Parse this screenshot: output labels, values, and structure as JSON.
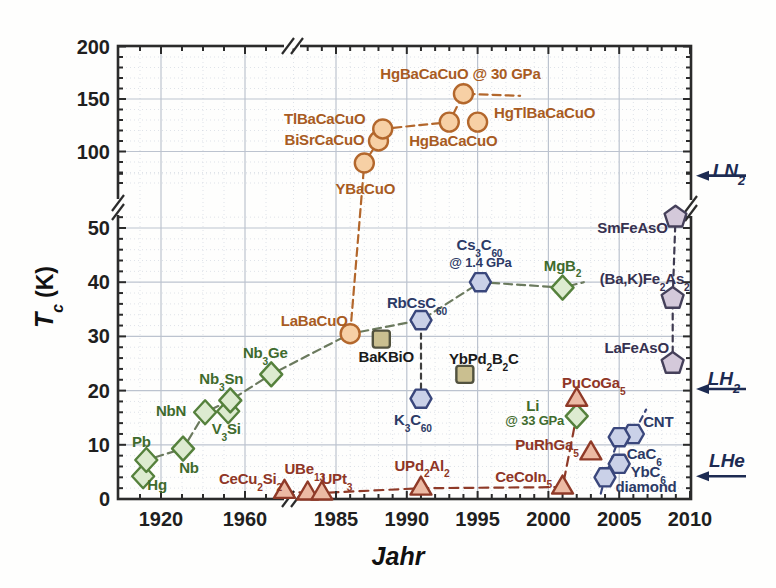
{
  "axes": {
    "xlabel": "Jahr",
    "ylabel_symbol": "T",
    "ylabel_subscript": "c",
    "ylabel_unit": "(K)",
    "x_ticks": [
      {
        "label": "1920",
        "year": 1920
      },
      {
        "label": "1960",
        "year": 1960
      },
      {
        "label": "1985",
        "year": 1985
      },
      {
        "label": "1990",
        "year": 1990
      },
      {
        "label": "1995",
        "year": 1995
      },
      {
        "label": "2000",
        "year": 2000
      },
      {
        "label": "2005",
        "year": 2005
      },
      {
        "label": "2010",
        "year": 2010
      }
    ],
    "y_ticks": [
      {
        "label": "0",
        "tc": 0
      },
      {
        "label": "10",
        "tc": 10
      },
      {
        "label": "20",
        "tc": 20
      },
      {
        "label": "30",
        "tc": 30
      },
      {
        "label": "40",
        "tc": 40
      },
      {
        "label": "50",
        "tc": 50
      },
      {
        "label": "100",
        "tc": 100
      },
      {
        "label": "150",
        "tc": 150
      },
      {
        "label": "200",
        "tc": 200
      }
    ]
  },
  "cryogens": {
    "color": "#1d2b52",
    "items": [
      {
        "id": "ln2",
        "label": "LN_2",
        "tc": 77,
        "label_dx": 3,
        "label_dy": -5
      },
      {
        "id": "lh2",
        "label": "LH_2",
        "tc": 20.3,
        "label_dx": -2,
        "label_dy": -10
      },
      {
        "id": "lhe",
        "label": "LHe",
        "tc": 4.2,
        "label_dx": 1,
        "label_dy": -15
      }
    ]
  },
  "chart_data": {
    "type": "scatter",
    "title": "",
    "xlabel": "Jahr",
    "ylabel": "T_c (K)",
    "x_axis": {
      "segments": [
        [
          1900,
          1976
        ],
        [
          1982,
          2010
        ]
      ],
      "break_between": [
        1976,
        1982
      ],
      "grid": true
    },
    "y_axis": {
      "unit": "K",
      "segments": [
        [
          0,
          55
        ],
        [
          60,
          200
        ]
      ],
      "break_between": [
        55,
        60
      ],
      "grid": true
    },
    "groups": {
      "conventional": {
        "marker_fill": "#ddebd0",
        "marker_stroke": "#55813c",
        "label_color": "#3f6b2d"
      },
      "cuprate": {
        "marker_fill": "#f7d0a5",
        "marker_stroke": "#b3672c",
        "label_color": "#a85b22"
      },
      "heavy_fermion": {
        "marker_fill": "#ecbaa4",
        "marker_stroke": "#8f3a28",
        "label_color": "#8f3626"
      },
      "carbon": {
        "marker_fill": "#cad1e8",
        "marker_stroke": "#3a477c",
        "label_color": "#2c3a66"
      },
      "iron_based": {
        "marker_fill": "#d4c9da",
        "marker_stroke": "#45405a",
        "label_color": "#363150"
      },
      "other": {
        "marker_fill": "#cabf90",
        "marker_stroke": "#52523f",
        "label_color": "#1a1a1a"
      }
    },
    "points": [
      {
        "name": "Hg",
        "group": "conventional",
        "shape": "diamond",
        "year": 1911.5,
        "tc": 4.2,
        "label": "Hg",
        "dx": 14,
        "dy": 9
      },
      {
        "name": "Pb",
        "group": "conventional",
        "shape": "diamond",
        "year": 1913,
        "tc": 7.2,
        "label": "Pb",
        "dx": -5,
        "dy": -18
      },
      {
        "name": "Nb",
        "group": "conventional",
        "shape": "diamond",
        "year": 1930.5,
        "tc": 9.3,
        "label": "Nb",
        "dx": 6,
        "dy": 19
      },
      {
        "name": "NbN",
        "group": "conventional",
        "shape": "diamond",
        "year": 1941,
        "tc": 16,
        "label": "NbN",
        "dx": -34,
        "dy": -1
      },
      {
        "name": "V3Si",
        "group": "conventional",
        "shape": "diamond",
        "year": 1952,
        "tc": 16.2,
        "label": "V_3Si",
        "dx": -2,
        "dy": 18
      },
      {
        "name": "Nb3Sn",
        "group": "conventional",
        "shape": "diamond",
        "year": 1953,
        "tc": 18.2,
        "label": "Nb_3Sn",
        "dx": -9,
        "dy": -21
      },
      {
        "name": "Nb3Ge",
        "group": "conventional",
        "shape": "diamond",
        "year": 1972.5,
        "tc": 23,
        "label": "Nb_3Ge",
        "dx": -6,
        "dy": -21
      },
      {
        "name": "MgB2",
        "group": "conventional",
        "shape": "diamond",
        "year": 2001,
        "tc": 39,
        "label": "MgB_2",
        "dx": 0,
        "dy": -22
      },
      {
        "name": "Li-33GPa",
        "group": "conventional",
        "shape": "diamond",
        "year": 2002,
        "tc": 15.3,
        "label": "Li",
        "dx": -44,
        "dy": -10,
        "label2": "@ 33 GPa",
        "dx2": -42,
        "dy2": 5
      },
      {
        "name": "LaBaCuO",
        "group": "cuprate",
        "shape": "circle",
        "year": 1986,
        "tc": 30.5,
        "label": "LaBaCuO",
        "dx": -36,
        "dy": -13
      },
      {
        "name": "YBaCuO",
        "group": "cuprate",
        "shape": "circle",
        "year": 1987,
        "tc": 89,
        "label": "YBaCuO",
        "dx": 1,
        "dy": 26
      },
      {
        "name": "BiSrCaCuO",
        "group": "cuprate",
        "shape": "circle",
        "year": 1988,
        "tc": 110,
        "label": "BiSrCaCuO",
        "dx": -54,
        "dy": -1
      },
      {
        "name": "TlBaCaCuO",
        "group": "cuprate",
        "shape": "circle",
        "year": 1988.3,
        "tc": 121.5,
        "label": "TlBaCaCuO",
        "dx": -58,
        "dy": -10
      },
      {
        "name": "HgBaCaCuO",
        "group": "cuprate",
        "shape": "circle",
        "year": 1993,
        "tc": 128,
        "label": "HgBaCaCuO",
        "dx": 4,
        "dy": 19
      },
      {
        "name": "HgBaCaCuO-30GPa",
        "group": "cuprate",
        "shape": "circle",
        "year": 1994,
        "tc": 155,
        "label": "HgBaCaCuO @ 30 GPa",
        "dx": -3,
        "dy": -20
      },
      {
        "name": "HgTlBaCaCuO",
        "group": "cuprate",
        "shape": "circle",
        "year": 1995,
        "tc": 128,
        "label": "HgTlBaCaCuO",
        "dx": 67,
        "dy": -9
      },
      {
        "name": "BaKBiO",
        "group": "other",
        "shape": "square",
        "year": 1988.2,
        "tc": 29.5,
        "label": "BaKBiO",
        "dx": 5,
        "dy": 18
      },
      {
        "name": "YbPd2B2C",
        "group": "other",
        "shape": "square",
        "year": 1994.1,
        "tc": 23,
        "label": "YbPd_2B_2C",
        "dx": 19,
        "dy": -15
      },
      {
        "name": "K3C60",
        "group": "carbon",
        "shape": "hexagon",
        "year": 1991,
        "tc": 18.5,
        "label": "K_3C_{60}",
        "dx": -8,
        "dy": 21
      },
      {
        "name": "RbCsC60",
        "group": "carbon",
        "shape": "hexagon",
        "year": 1991,
        "tc": 33,
        "label": "RbCsC_{60}",
        "dx": -4,
        "dy": -17
      },
      {
        "name": "Cs3C60-1.4GPa",
        "group": "carbon",
        "shape": "hexagon",
        "year": 1995.2,
        "tc": 40,
        "label": "Cs_3C_{60}",
        "dx": -1,
        "dy": -37,
        "label2": "@ 1.4 GPa",
        "dx2": 0,
        "dy2": -19
      },
      {
        "name": "CNT",
        "group": "carbon",
        "shape": "hexagon",
        "year": 2006,
        "tc": 12,
        "label": "CNT",
        "dx": 25,
        "dy": -12
      },
      {
        "name": "CaC6",
        "group": "carbon",
        "shape": "hexagon",
        "year": 2005,
        "tc": 11.4,
        "label": "CaC_6",
        "dx": 25,
        "dy": 17
      },
      {
        "name": "YbC6",
        "group": "carbon",
        "shape": "hexagon",
        "year": 2005,
        "tc": 6.5,
        "label": "YbC_6",
        "dx": 29,
        "dy": 8
      },
      {
        "name": "diamond",
        "group": "carbon",
        "shape": "hexagon",
        "year": 2004,
        "tc": 4,
        "label": "diamond",
        "dx": 41,
        "dy": 10
      },
      {
        "name": "CeCu2Si2",
        "group": "heavy_fermion",
        "shape": "triangle",
        "year": 1978.8,
        "tc": 1.5,
        "label": "CeCu_2Si_2",
        "dx": -34,
        "dy": -12
      },
      {
        "name": "UBe13",
        "group": "heavy_fermion",
        "shape": "triangle",
        "year": 1983,
        "tc": 1.2,
        "label": "UBe_{13}",
        "dx": -3,
        "dy": -23
      },
      {
        "name": "UPt3",
        "group": "heavy_fermion",
        "shape": "triangle",
        "year": 1984,
        "tc": 1.2,
        "label": "UPt_3",
        "dx": 15,
        "dy": -13
      },
      {
        "name": "UPd2Al2",
        "group": "heavy_fermion",
        "shape": "triangle",
        "year": 1991,
        "tc": 2.1,
        "label": "UPd_2Al_2",
        "dx": 1,
        "dy": -22
      },
      {
        "name": "CeCoIn5",
        "group": "heavy_fermion",
        "shape": "triangle",
        "year": 2001,
        "tc": 2.3,
        "label": "CeCoIn_5",
        "dx": -39,
        "dy": -10
      },
      {
        "name": "PuCoGa5",
        "group": "heavy_fermion",
        "shape": "triangle",
        "year": 2002,
        "tc": 18.5,
        "label": "PuCoGa_5",
        "dx": 17,
        "dy": -16
      },
      {
        "name": "PuRhGa5",
        "group": "heavy_fermion",
        "shape": "triangle",
        "year": 2003,
        "tc": 8.6,
        "label": "PuRhGa_5",
        "dx": -44,
        "dy": -7
      },
      {
        "name": "LaFeAsO",
        "group": "iron_based",
        "shape": "pentagon",
        "year": 2008,
        "tc": 25,
        "nx": 11,
        "label": "LaFeAsO",
        "dx": -36,
        "dy": -16
      },
      {
        "name": "BaKFe2As2",
        "group": "iron_based",
        "shape": "pentagon",
        "year": 2008,
        "tc": 37,
        "nx": 11,
        "label": "(Ba,K)Fe_2As_2",
        "dx": -28,
        "dy": -19
      },
      {
        "name": "SmFeAsO",
        "group": "iron_based",
        "shape": "pentagon",
        "year": 2008.2,
        "tc": 52,
        "nx": 11,
        "label": "SmFeAsO",
        "dx": -43,
        "dy": 11
      }
    ],
    "trend_paths": [
      {
        "id": "conventional-trend",
        "group": "conventional",
        "color": "#6b7a5e",
        "dash": "8,5",
        "points": [
          [
            1911.5,
            4.2
          ],
          [
            1913,
            7.2
          ],
          [
            1930.5,
            9.3
          ],
          [
            1941,
            16
          ],
          [
            1953,
            18.2
          ],
          [
            1972.5,
            23
          ],
          [
            1986,
            30.5
          ],
          [
            1991,
            33
          ],
          [
            1995.2,
            40
          ],
          [
            2001,
            39
          ],
          [
            2002.5,
            40
          ]
        ]
      },
      {
        "id": "cuprate-trend",
        "group": "cuprate",
        "color": "#b3672c",
        "dash": "8,5",
        "points": [
          [
            1986,
            30.5
          ],
          [
            1987,
            89
          ],
          [
            1988,
            110
          ],
          [
            1988.3,
            121.5
          ],
          [
            1993,
            128
          ],
          [
            1994,
            155
          ],
          [
            1998,
            153
          ]
        ]
      },
      {
        "id": "heavy-fermion-trend",
        "group": "heavy_fermion",
        "color": "#8f3a28",
        "dash": "9,6",
        "points": [
          [
            1978.8,
            1.4
          ],
          [
            1983,
            1.1
          ],
          [
            1984,
            1.1
          ],
          [
            1991,
            2
          ],
          [
            2001,
            2.2
          ],
          [
            2002.3,
            19.5
          ]
        ]
      },
      {
        "id": "fullerene-link",
        "group": "carbon",
        "color": "#3e3e3e",
        "dash": "5,5",
        "points": [
          [
            1991,
            18.5
          ],
          [
            1991,
            33
          ]
        ]
      },
      {
        "id": "carbon-trend",
        "group": "carbon",
        "color": "#3a477c",
        "dash": "6,5",
        "points": [
          [
            2003.7,
            1
          ],
          [
            2004,
            4
          ],
          [
            2005,
            11.4
          ],
          [
            2006,
            12
          ],
          [
            2006.9,
            16.5
          ]
        ]
      },
      {
        "id": "iron-based-link",
        "group": "iron_based",
        "color": "#3e3a50",
        "dash": "6,5",
        "points": [
          [
            2008,
            25,
            11
          ],
          [
            2008,
            37,
            11
          ],
          [
            2008.2,
            52,
            11
          ]
        ]
      }
    ]
  }
}
